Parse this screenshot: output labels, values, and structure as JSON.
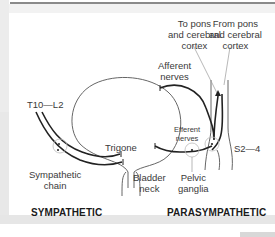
{
  "labels": {
    "to_pons": [
      "To pons",
      "and cerebral",
      "cortex"
    ],
    "from_pons": [
      "From pons",
      "and cerebral",
      "cortex"
    ],
    "afferent_nerves": [
      "Afferent",
      "nerves"
    ],
    "efferent_nerves": [
      "Efferent",
      "nerves"
    ],
    "t10_l2": "T10—L2",
    "s2_4": "S2—4",
    "trigone": "Trigone",
    "sympathetic_chain": [
      "Sympathetic",
      "chain"
    ],
    "bladder_neck": [
      "Bladder",
      "neck"
    ],
    "pelvic_ganglia": [
      "Pelvic",
      "ganglia"
    ]
  },
  "headings": {
    "sympathetic": "SYMPATHETIC",
    "parasympathetic": "PARASYMPATHETIC"
  }
}
